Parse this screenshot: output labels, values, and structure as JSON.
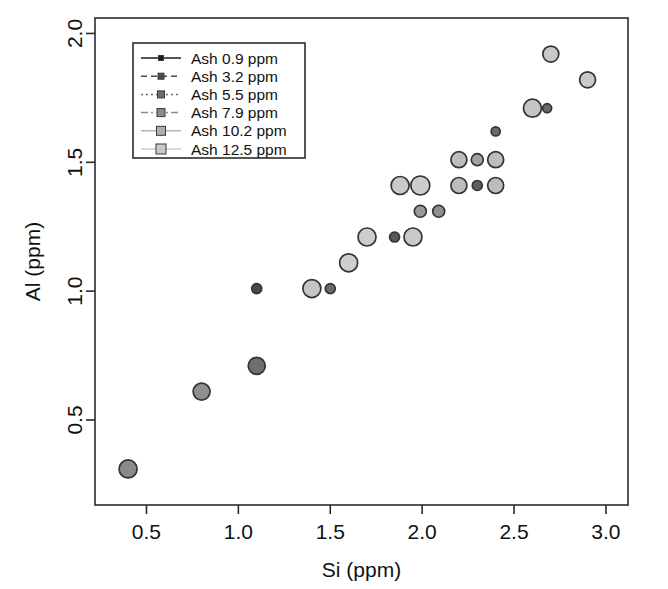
{
  "chart_data": {
    "type": "scatter",
    "title": "",
    "xlabel": "Si (ppm)",
    "ylabel": "Al (ppm)",
    "xlim": [
      0.22,
      3.12
    ],
    "ylim": [
      0.17,
      2.06
    ],
    "xticks": [
      0.5,
      1.0,
      1.5,
      2.0,
      2.5,
      3.0
    ],
    "xticklabels": [
      "0.5",
      "1.0",
      "1.5",
      "2.0",
      "2.5",
      "3.0"
    ],
    "yticks": [
      0.5,
      1.0,
      1.5,
      2.0
    ],
    "yticklabels": [
      "0.5",
      "1.0",
      "1.5",
      "2.0"
    ],
    "grid": false,
    "legend_position": "top-left",
    "legend_title": "",
    "series": [
      {
        "name": "Ash 0.9  ppm",
        "marker_fill": "#1d1d1d",
        "marker_size": 5,
        "linestyle": "solid"
      },
      {
        "name": "Ash 3.2  ppm",
        "marker_fill": "#4a4a4a",
        "marker_size": 6,
        "linestyle": "dashed"
      },
      {
        "name": "Ash 5.5  ppm",
        "marker_fill": "#6d6d6d",
        "marker_size": 7,
        "linestyle": "dotted"
      },
      {
        "name": "Ash 7.9  ppm",
        "marker_fill": "#8c8c8c",
        "marker_size": 8,
        "linestyle": "dashdot"
      },
      {
        "name": "Ash 10.2  ppm",
        "marker_fill": "#aeaeae",
        "marker_size": 9,
        "linestyle": "solid-light"
      },
      {
        "name": "Ash 12.5  ppm",
        "marker_fill": "#c9c9c9",
        "marker_size": 10,
        "linestyle": "solid-light"
      }
    ],
    "points": [
      {
        "x": 0.4,
        "y": 0.31,
        "r": 9.0,
        "fill": "#8a8a8a"
      },
      {
        "x": 0.8,
        "y": 0.61,
        "r": 8.5,
        "fill": "#8f8f8f"
      },
      {
        "x": 1.1,
        "y": 0.71,
        "r": 8.5,
        "fill": "#6f6f6f"
      },
      {
        "x": 1.1,
        "y": 1.01,
        "r": 5.0,
        "fill": "#4a4a4a"
      },
      {
        "x": 1.4,
        "y": 1.01,
        "r": 9.0,
        "fill": "#c4c4c4"
      },
      {
        "x": 1.5,
        "y": 1.01,
        "r": 5.0,
        "fill": "#6b6b6b"
      },
      {
        "x": 1.6,
        "y": 1.11,
        "r": 9.0,
        "fill": "#cfcfcf"
      },
      {
        "x": 1.7,
        "y": 1.21,
        "r": 9.0,
        "fill": "#cccccc"
      },
      {
        "x": 1.85,
        "y": 1.21,
        "r": 5.0,
        "fill": "#5a5a5a"
      },
      {
        "x": 1.95,
        "y": 1.21,
        "r": 9.0,
        "fill": "#c9c9c9"
      },
      {
        "x": 1.88,
        "y": 1.41,
        "r": 9.0,
        "fill": "#c9c9c9"
      },
      {
        "x": 1.99,
        "y": 1.41,
        "r": 9.5,
        "fill": "#cdcdcd"
      },
      {
        "x": 1.99,
        "y": 1.31,
        "r": 6.0,
        "fill": "#9a9a9a"
      },
      {
        "x": 2.09,
        "y": 1.31,
        "r": 6.0,
        "fill": "#8f8f8f"
      },
      {
        "x": 2.2,
        "y": 1.41,
        "r": 8.0,
        "fill": "#bdbdbd"
      },
      {
        "x": 2.3,
        "y": 1.41,
        "r": 5.0,
        "fill": "#5f5f5f"
      },
      {
        "x": 2.4,
        "y": 1.41,
        "r": 8.0,
        "fill": "#bdbdbd"
      },
      {
        "x": 2.2,
        "y": 1.51,
        "r": 8.0,
        "fill": "#bdbdbd"
      },
      {
        "x": 2.3,
        "y": 1.51,
        "r": 6.0,
        "fill": "#a3a3a3"
      },
      {
        "x": 2.4,
        "y": 1.51,
        "r": 8.0,
        "fill": "#bdbdbd"
      },
      {
        "x": 2.4,
        "y": 1.62,
        "r": 4.5,
        "fill": "#6a6a6a"
      },
      {
        "x": 2.6,
        "y": 1.71,
        "r": 9.0,
        "fill": "#c4c4c4"
      },
      {
        "x": 2.68,
        "y": 1.71,
        "r": 4.5,
        "fill": "#6a6a6a"
      },
      {
        "x": 2.7,
        "y": 1.92,
        "r": 8.0,
        "fill": "#c9c9c9"
      },
      {
        "x": 2.9,
        "y": 1.82,
        "r": 8.0,
        "fill": "#c9c9c9"
      }
    ],
    "marker_edge_color": "#333333",
    "axis_color": "#2b2b2b"
  }
}
